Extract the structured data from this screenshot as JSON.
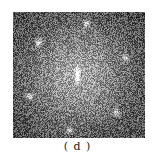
{
  "figure": {
    "caption": "( d )",
    "panel_type": "fft-power-spectrum",
    "panel": {
      "x": 13,
      "y": 12,
      "width": 132,
      "height": 126
    },
    "center_peak": {
      "x": 64,
      "y": 63
    },
    "spots": [
      {
        "x": 73,
        "y": 11
      },
      {
        "x": 25,
        "y": 30
      },
      {
        "x": 112,
        "y": 45
      },
      {
        "x": 16,
        "y": 84
      },
      {
        "x": 103,
        "y": 100
      },
      {
        "x": 56,
        "y": 118
      }
    ],
    "colors": {
      "background": "#ffffff",
      "caption": "#222222"
    }
  }
}
